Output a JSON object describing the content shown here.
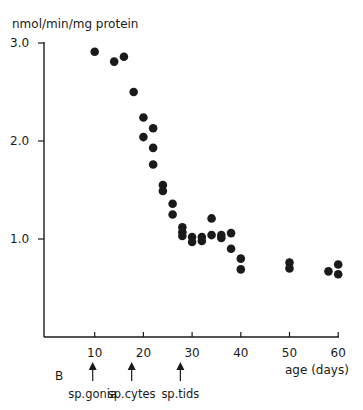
{
  "chart_data": {
    "type": "scatter",
    "title": "",
    "panel_label": "B",
    "ylabel": "nmol/min/mg protein",
    "xlabel": "age (days)",
    "xlim": [
      0,
      60
    ],
    "ylim": [
      0,
      3.0
    ],
    "x_ticks": [
      10,
      20,
      30,
      40,
      50,
      60
    ],
    "x_tick_labels": [
      "10",
      "20",
      "30",
      "40",
      "50",
      "60"
    ],
    "y_ticks": [
      1.0,
      2.0,
      3.0
    ],
    "y_tick_labels": [
      "1.0",
      "2.0",
      "3.0"
    ],
    "grid": false,
    "legend": null,
    "marker_color": "#1a1a1a",
    "points": [
      {
        "x": 10,
        "y": 2.91
      },
      {
        "x": 14,
        "y": 2.81
      },
      {
        "x": 16,
        "y": 2.86
      },
      {
        "x": 18,
        "y": 2.5
      },
      {
        "x": 20,
        "y": 2.24
      },
      {
        "x": 22,
        "y": 2.13
      },
      {
        "x": 20,
        "y": 2.04
      },
      {
        "x": 22,
        "y": 1.93
      },
      {
        "x": 22,
        "y": 1.76
      },
      {
        "x": 24,
        "y": 1.55
      },
      {
        "x": 24,
        "y": 1.49
      },
      {
        "x": 26,
        "y": 1.36
      },
      {
        "x": 26,
        "y": 1.25
      },
      {
        "x": 28,
        "y": 1.12
      },
      {
        "x": 28,
        "y": 1.07
      },
      {
        "x": 28,
        "y": 1.03
      },
      {
        "x": 30,
        "y": 1.02
      },
      {
        "x": 30,
        "y": 0.97
      },
      {
        "x": 32,
        "y": 1.02
      },
      {
        "x": 32,
        "y": 0.98
      },
      {
        "x": 34,
        "y": 1.21
      },
      {
        "x": 34,
        "y": 1.04
      },
      {
        "x": 36,
        "y": 1.01
      },
      {
        "x": 36,
        "y": 1.04
      },
      {
        "x": 38,
        "y": 1.06
      },
      {
        "x": 38,
        "y": 0.9
      },
      {
        "x": 40,
        "y": 0.8
      },
      {
        "x": 40,
        "y": 0.69
      },
      {
        "x": 50,
        "y": 0.76
      },
      {
        "x": 50,
        "y": 0.7
      },
      {
        "x": 58,
        "y": 0.67
      },
      {
        "x": 60,
        "y": 0.74
      },
      {
        "x": 60,
        "y": 0.64
      }
    ],
    "annotations": [
      {
        "x": 10,
        "label": "sp.gonia",
        "type": "arrow"
      },
      {
        "x": 18,
        "label": "sp.cytes",
        "type": "arrow"
      },
      {
        "x": 28,
        "label": "sp.tids",
        "type": "arrow"
      }
    ]
  }
}
